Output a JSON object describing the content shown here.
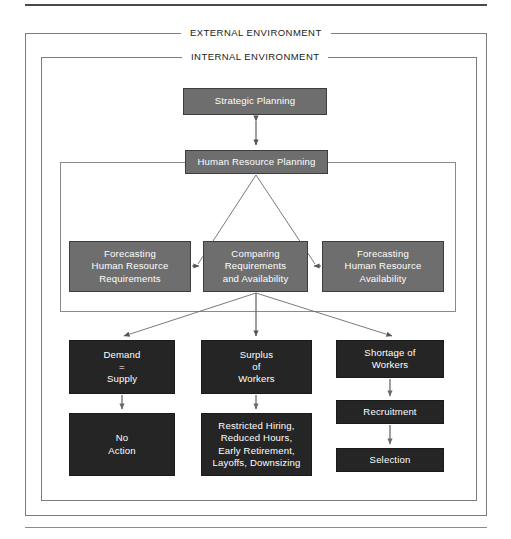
{
  "diagram": {
    "frames": {
      "external_label": "EXTERNAL ENVIRONMENT",
      "internal_label": "INTERNAL ENVIRONMENT"
    },
    "colors": {
      "gray_box": "#6e6e6e",
      "dark_box": "#252525",
      "box_text": "#ffffff",
      "frame_line": "#7c7c7c",
      "connector": "#6b6b6b",
      "rule": "#4a4a4a",
      "page_background": "#ffffff"
    },
    "nodes": {
      "strategic_planning": "Strategic Planning",
      "human_resource_planning": "Human Resource Planning",
      "forecasting_requirements": "Forecasting\nHuman Resource\nRequirements",
      "comparing": "Comparing\nRequirements\nand Availability",
      "forecasting_availability": "Forecasting\nHuman Resource\nAvailability",
      "demand_equals_supply": "Demand\n=\nSupply",
      "no_action": "No\nAction",
      "surplus_of_workers": "Surplus\nof\nWorkers",
      "restricted_actions": "Restricted Hiring,\nReduced Hours,\nEarly Retirement,\nLayoffs, Downsizing",
      "shortage_of_workers": "Shortage of\nWorkers",
      "recruitment": "Recruitment",
      "selection": "Selection"
    },
    "edges": [
      {
        "from": "strategic_planning",
        "to": "human_resource_planning",
        "style": "double-arrow-vertical"
      },
      {
        "from": "human_resource_planning",
        "to": "comparing",
        "style": "branch-left"
      },
      {
        "from": "human_resource_planning",
        "to": "comparing",
        "style": "branch-right"
      },
      {
        "from": "forecasting_requirements",
        "to": "comparing",
        "style": "arrow-right"
      },
      {
        "from": "forecasting_availability",
        "to": "comparing",
        "style": "arrow-left"
      },
      {
        "from": "comparing",
        "to": "demand_equals_supply",
        "style": "arrow-diagonal-left"
      },
      {
        "from": "comparing",
        "to": "surplus_of_workers",
        "style": "arrow-vertical"
      },
      {
        "from": "comparing",
        "to": "shortage_of_workers",
        "style": "arrow-diagonal-right"
      },
      {
        "from": "demand_equals_supply",
        "to": "no_action",
        "style": "arrow-vertical"
      },
      {
        "from": "surplus_of_workers",
        "to": "restricted_actions",
        "style": "arrow-vertical"
      },
      {
        "from": "shortage_of_workers",
        "to": "recruitment",
        "style": "arrow-vertical"
      },
      {
        "from": "recruitment",
        "to": "selection",
        "style": "arrow-vertical"
      }
    ]
  }
}
